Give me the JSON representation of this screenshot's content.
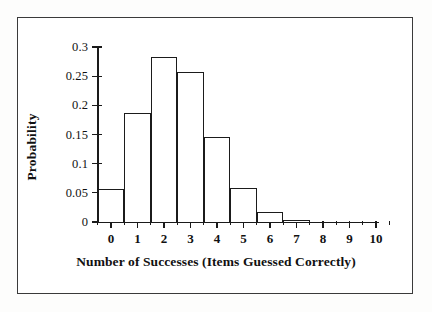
{
  "chart_data": {
    "type": "bar",
    "title": "",
    "subtitle": "",
    "xlabel": "Number of Successes (Items Guessed Correctly)",
    "ylabel": "Probability",
    "categories": [
      "0",
      "1",
      "2",
      "3",
      "4",
      "5",
      "6",
      "7",
      "8",
      "9",
      "10"
    ],
    "values": [
      0.057,
      0.187,
      0.283,
      0.257,
      0.146,
      0.058,
      0.018,
      0.004,
      0.0,
      0.0,
      0.0
    ],
    "xlim": [
      -0.5,
      10.5
    ],
    "ylim": [
      0,
      0.3
    ],
    "ytick_labels": [
      "0",
      "0.05",
      "0.1",
      "0.15",
      "0.2",
      "0.25",
      "0.3"
    ],
    "ytick_values": [
      0,
      0.05,
      0.1,
      0.15,
      0.2,
      0.25,
      0.3
    ],
    "xtick_labels": [
      "0",
      "1",
      "2",
      "3",
      "4",
      "5",
      "6",
      "7",
      "8",
      "9",
      "10"
    ],
    "xtick_values": [
      0,
      1,
      2,
      3,
      4,
      5,
      6,
      7,
      8,
      9,
      10
    ],
    "grid": false,
    "legend": false,
    "bar_fill_color": "#ffffff",
    "bar_edge_color": "#1b1b1b",
    "axis_color": "#1a1a1a",
    "background_color": "#ffffff"
  }
}
